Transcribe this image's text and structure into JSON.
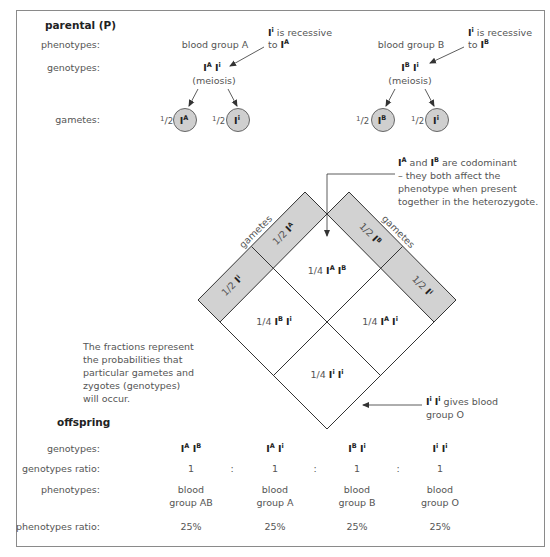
{
  "parental": {
    "title": "parental (P)",
    "row_labels": {
      "phenotypes": "phenotypes:",
      "genotypes": "genotypes:",
      "gametes": "gametes:"
    },
    "parent_a": {
      "phenotype": "blood group A",
      "genotype": {
        "allele1": "I",
        "sup1": "A",
        "allele2": "I",
        "sup2": "i"
      },
      "process": "(meiosis)",
      "gametes": [
        {
          "fraction_num": "1",
          "fraction_den": "2",
          "allele": "I",
          "sup": "A"
        },
        {
          "fraction_num": "1",
          "fraction_den": "2",
          "allele": "I",
          "sup": "i"
        }
      ],
      "note": {
        "line1_allele": "I",
        "line1_sup": "i",
        "line1_text": " is recessive",
        "line2_text": "to ",
        "line2_allele": "I",
        "line2_sup": "A"
      }
    },
    "parent_b": {
      "phenotype": "blood group B",
      "genotype": {
        "allele1": "I",
        "sup1": "B",
        "allele2": "I",
        "sup2": "i"
      },
      "process": "(meiosis)",
      "gametes": [
        {
          "fraction_num": "1",
          "fraction_den": "2",
          "allele": "I",
          "sup": "B"
        },
        {
          "fraction_num": "1",
          "fraction_den": "2",
          "allele": "I",
          "sup": "i"
        }
      ],
      "note": {
        "line1_allele": "I",
        "line1_sup": "i",
        "line1_text": " is recessive",
        "line2_text": "to ",
        "line2_allele": "I",
        "line2_sup": "B"
      }
    }
  },
  "punnett": {
    "left_band_label": "gametes",
    "right_band_label": "gametes",
    "left_band": [
      {
        "frac": "1/2",
        "allele": "I",
        "sup": "A"
      },
      {
        "frac": "1/2",
        "allele": "I",
        "sup": "i"
      }
    ],
    "right_band": [
      {
        "frac": "1/2",
        "allele": "I",
        "sup": "B"
      },
      {
        "frac": "1/2",
        "allele": "I",
        "sup": "i"
      }
    ],
    "cells": {
      "top": {
        "frac": "1/4",
        "a1": "I",
        "s1": "A",
        "a2": "I",
        "s2": "B"
      },
      "left": {
        "frac": "1/4",
        "a1": "I",
        "s1": "B",
        "a2": "I",
        "s2": "i"
      },
      "right": {
        "frac": "1/4",
        "a1": "I",
        "s1": "A",
        "a2": "I",
        "s2": "i"
      },
      "bottom": {
        "frac": "1/4",
        "a1": "I",
        "s1": "i",
        "a2": "I",
        "s2": "i"
      }
    },
    "band_fill": "#d2d2d2",
    "line_color": "#333333"
  },
  "annotations": {
    "codominant": {
      "a1": "I",
      "s1": "A",
      "mid": " and ",
      "a2": "I",
      "s2": "B",
      "tail": " are codominant",
      "lines": [
        "– they both affect the",
        "phenotype when present",
        "together in the heterozygote."
      ]
    },
    "fractions_note": [
      "The fractions represent",
      "the probabilities that",
      "particular gametes and",
      "zygotes (genotypes)",
      "will occur."
    ],
    "group_o": {
      "a1": "I",
      "s1": "i",
      "a2": "I",
      "s2": "i",
      "line1": " gives blood",
      "line2": "group O"
    }
  },
  "offspring": {
    "title": "offspring",
    "row_labels": {
      "genotypes": "genotypes:",
      "genotypes_ratio": "genotypes ratio:",
      "phenotypes": "phenotypes:",
      "phenotypes_ratio": "phenotypes ratio:"
    },
    "separator": ":",
    "columns": [
      {
        "a1": "I",
        "s1": "A",
        "a2": "I",
        "s2": "B",
        "ratio": "1",
        "phen1": "blood",
        "phen2": "group AB",
        "pct": "25%"
      },
      {
        "a1": "I",
        "s1": "A",
        "a2": "I",
        "s2": "i",
        "ratio": "1",
        "phen1": "blood",
        "phen2": "group A",
        "pct": "25%"
      },
      {
        "a1": "I",
        "s1": "B",
        "a2": "I",
        "s2": "i",
        "ratio": "1",
        "phen1": "blood",
        "phen2": "group B",
        "pct": "25%"
      },
      {
        "a1": "I",
        "s1": "i",
        "a2": "I",
        "s2": "i",
        "ratio": "1",
        "phen1": "blood",
        "phen2": "group O",
        "pct": "25%"
      }
    ]
  }
}
